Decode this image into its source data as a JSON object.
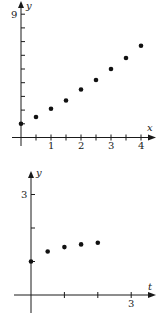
{
  "chart_data": [
    {
      "type": "scatter",
      "title": "",
      "xlabel": "x",
      "ylabel": "y",
      "xlim": [
        0,
        4.4
      ],
      "ylim": [
        0,
        9.5
      ],
      "x_tick_labels": [
        "1",
        "2",
        "3",
        "4"
      ],
      "y_tick_labels": [
        "9"
      ],
      "x_ticks_every": 0.5,
      "y_ticks_every": 1,
      "grid": false,
      "legend": null,
      "x": [
        0,
        0.5,
        1,
        1.5,
        2,
        2.5,
        3,
        3.5,
        4
      ],
      "y": [
        1.0,
        1.5,
        2.1,
        2.7,
        3.5,
        4.2,
        5.0,
        5.8,
        6.7
      ],
      "layout": {
        "ox": 21,
        "oy": 137.5,
        "sx": 30,
        "sy": 13.7,
        "x_end": 155,
        "y_end": 3
      }
    },
    {
      "type": "scatter",
      "title": "",
      "xlabel": "t",
      "ylabel": "y",
      "xlim": [
        0,
        3.7
      ],
      "ylim": [
        0,
        3.5
      ],
      "x_tick_labels": [
        "3"
      ],
      "y_tick_labels": [
        "3"
      ],
      "x_ticks_every": 1,
      "y_ticks_every": 1,
      "grid": false,
      "legend": null,
      "x": [
        0,
        0.5,
        1,
        1.5,
        2
      ],
      "y": [
        1.0,
        1.3,
        1.43,
        1.51,
        1.56
      ],
      "layout": {
        "ox": 31,
        "oy": 295,
        "sx": 33.4,
        "sy": 33.5,
        "x_end": 155,
        "y_end": 172
      }
    }
  ],
  "labels": {
    "top": {
      "x_axis": "x",
      "y_axis": "y",
      "x_ticks": [
        "1",
        "2",
        "3",
        "4"
      ],
      "y_max": "9"
    },
    "bottom": {
      "x_axis": "t",
      "y_axis": "y",
      "x_tick": "3",
      "y_tick": "3"
    }
  }
}
